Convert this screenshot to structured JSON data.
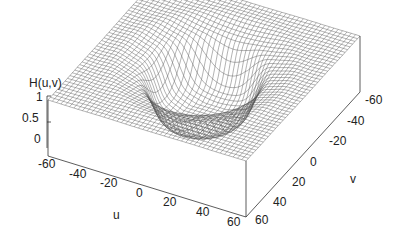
{
  "chart_data": {
    "type": "surface",
    "title": "",
    "zlabel": "H(u,v)",
    "xlabel": "u",
    "ylabel": "v",
    "z_ticks": [
      "1",
      "0.5",
      "0"
    ],
    "u_ticks": [
      "-60",
      "-40",
      "-20",
      "0",
      "20",
      "40",
      "60"
    ],
    "v_ticks": [
      "-60",
      "-40",
      "-20",
      "0",
      "20",
      "40",
      "60"
    ],
    "u_range": [
      -64,
      64
    ],
    "v_range": [
      -64,
      64
    ],
    "zlim": [
      0,
      1
    ],
    "cutoff_radius": 30,
    "grid": "wireframe mesh",
    "line_color": "#555555"
  }
}
